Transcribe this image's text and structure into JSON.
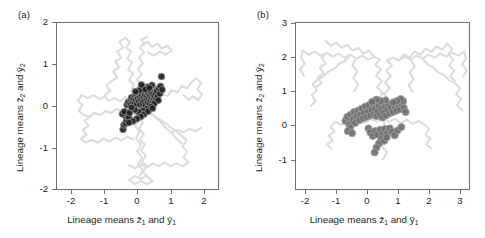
{
  "figure": {
    "panels": [
      {
        "tag": "(a)",
        "axis_x_title_parts": [
          "Lineage means ",
          "z",
          "1",
          " and ",
          "y",
          "1"
        ],
        "axis_y_title_parts": [
          "Lineage means ",
          "z",
          "2",
          " and ",
          "y",
          "2"
        ],
        "xticks": [
          "-2",
          "-1",
          "0",
          "1",
          "2"
        ],
        "yticks": [
          "2",
          "1",
          "0",
          "-1",
          "-2"
        ]
      },
      {
        "tag": "(b)",
        "axis_x_title_parts": [
          "Lineage means ",
          "z",
          "1",
          " and ",
          "y",
          "1"
        ],
        "axis_y_title_parts": [
          "Lineage means ",
          "z",
          "2",
          " and ",
          "y",
          "2"
        ],
        "xticks": [
          "-2",
          "-1",
          "0",
          "1",
          "2",
          "3"
        ],
        "yticks": [
          "3",
          "2",
          "1",
          "0",
          "-1"
        ]
      }
    ]
  },
  "chart_data": [
    {
      "type": "scatter",
      "panel": "(a)",
      "title": "",
      "xlabel": "Lineage means z̄1 and ȳ1",
      "ylabel": "Lineage means z̄2 and ȳ2",
      "xlim": [
        -2.45,
        2.45
      ],
      "ylim": [
        -2.2,
        2.2
      ],
      "xticks": [
        -2,
        -1,
        0,
        1,
        2
      ],
      "yticks": [
        -2,
        -1,
        0,
        1,
        2
      ],
      "grid": false,
      "legend": "none",
      "series": [
        {
          "name": "lineage random-walk trajectories",
          "role": "background-paths",
          "color": "#d9d9d9",
          "description": "Pale grey diffusing random-walk traces radiating from origin; dense lobes near (0,1.4), (-0.8,0.6), (0.9,0.5), (0.6,-1.2), (0,-1.8)."
        },
        {
          "name": "lineage means",
          "role": "markers",
          "marker": "filled-circle-with-ring",
          "fill": "#231f20",
          "edge": "#8c8c8c",
          "points": [
            [
              -0.44,
              -0.62
            ],
            [
              -0.41,
              -0.5
            ],
            [
              -0.36,
              -0.46
            ],
            [
              -0.33,
              -0.38
            ],
            [
              -0.35,
              -0.27
            ],
            [
              -0.3,
              -0.21
            ],
            [
              -0.46,
              -0.21
            ],
            [
              -0.4,
              -0.15
            ],
            [
              -0.27,
              -0.3
            ],
            [
              -0.24,
              -0.18
            ],
            [
              -0.32,
              0.03
            ],
            [
              -0.28,
              0.1
            ],
            [
              -0.22,
              0.06
            ],
            [
              -0.2,
              0.16
            ],
            [
              -0.16,
              0.09
            ],
            [
              -0.18,
              0.22
            ],
            [
              -0.12,
              0.19
            ],
            [
              -0.1,
              0.07
            ],
            [
              -0.08,
              0.25
            ],
            [
              -0.05,
              0.15
            ],
            [
              -0.02,
              0.05
            ],
            [
              -0.04,
              0.28
            ],
            [
              0.0,
              0.2
            ],
            [
              0.02,
              0.31
            ],
            [
              0.04,
              0.12
            ],
            [
              0.06,
              0.24
            ],
            [
              0.08,
              0.04
            ],
            [
              0.09,
              0.33
            ],
            [
              0.11,
              0.17
            ],
            [
              0.13,
              0.27
            ],
            [
              0.15,
              0.08
            ],
            [
              0.16,
              0.36
            ],
            [
              0.18,
              0.21
            ],
            [
              0.2,
              0.13
            ],
            [
              0.22,
              0.3
            ],
            [
              0.24,
              0.02
            ],
            [
              0.25,
              0.38
            ],
            [
              0.27,
              0.18
            ],
            [
              0.29,
              0.26
            ],
            [
              0.31,
              0.1
            ],
            [
              0.33,
              0.33
            ],
            [
              0.35,
              0.2
            ],
            [
              0.36,
              0.05
            ],
            [
              0.38,
              0.29
            ],
            [
              0.4,
              0.15
            ],
            [
              0.42,
              0.36
            ],
            [
              0.44,
              0.22
            ],
            [
              0.46,
              0.09
            ],
            [
              0.47,
              0.31
            ],
            [
              0.49,
              0.18
            ],
            [
              0.51,
              0.27
            ],
            [
              0.53,
              0.12
            ],
            [
              0.55,
              0.34
            ],
            [
              0.57,
              0.21
            ],
            [
              0.59,
              0.4
            ],
            [
              0.61,
              0.26
            ],
            [
              0.63,
              0.15
            ],
            [
              0.65,
              0.46
            ],
            [
              0.68,
              0.33
            ],
            [
              0.7,
              0.52
            ],
            [
              0.73,
              0.78
            ],
            [
              0.75,
              0.43
            ],
            [
              0.44,
              0.55
            ],
            [
              0.3,
              0.5
            ],
            [
              0.18,
              0.48
            ],
            [
              0.06,
              0.42
            ],
            [
              -0.06,
              0.38
            ],
            [
              0.12,
              0.56
            ],
            [
              0.24,
              0.44
            ],
            [
              0.36,
              0.48
            ],
            [
              0.5,
              0.05
            ],
            [
              0.41,
              -0.02
            ],
            [
              0.28,
              -0.08
            ],
            [
              0.16,
              -0.12
            ],
            [
              0.04,
              -0.16
            ],
            [
              -0.08,
              -0.1
            ],
            [
              -0.18,
              -0.04
            ],
            [
              0.2,
              -0.22
            ],
            [
              0.1,
              -0.28
            ],
            [
              -0.02,
              -0.34
            ],
            [
              -0.14,
              -0.4
            ],
            [
              -0.26,
              -0.44
            ],
            [
              0.32,
              -0.14
            ],
            [
              0.46,
              -0.06
            ]
          ]
        }
      ]
    },
    {
      "type": "scatter",
      "panel": "(b)",
      "title": "",
      "xlabel": "Lineage means z̄1 and ȳ1",
      "ylabel": "Lineage means z̄2 and ȳ2",
      "xlim": [
        -2.35,
        3.35
      ],
      "ylim": [
        -1.55,
        3.3
      ],
      "xticks": [
        -2,
        -1,
        0,
        1,
        2,
        3
      ],
      "yticks": [
        -1,
        0,
        1,
        2,
        3
      ],
      "grid": false,
      "legend": "none",
      "series": [
        {
          "name": "lineage random-walk trajectories",
          "role": "background-paths",
          "color": "#d9d9d9",
          "description": "Pale grey traces forming a broad band across the upper region near y=1.5-2.1 spanning x=-2 to 3, plus lighter wisps descending toward the central cluster."
        },
        {
          "name": "lineage means",
          "role": "markers",
          "marker": "filled-circle-with-ring",
          "fill": "#6f6f6f",
          "edge": "#9e9e9e",
          "points": [
            [
              -0.72,
              0.44
            ],
            [
              -0.66,
              0.56
            ],
            [
              -0.6,
              0.34
            ],
            [
              -0.55,
              0.62
            ],
            [
              -0.48,
              0.48
            ],
            [
              -0.44,
              0.7
            ],
            [
              -0.4,
              0.38
            ],
            [
              -0.35,
              0.58
            ],
            [
              -0.3,
              0.74
            ],
            [
              -0.26,
              0.46
            ],
            [
              -0.22,
              0.64
            ],
            [
              -0.18,
              0.8
            ],
            [
              -0.14,
              0.52
            ],
            [
              -0.1,
              0.68
            ],
            [
              -0.06,
              0.86
            ],
            [
              -0.02,
              0.56
            ],
            [
              0.02,
              0.72
            ],
            [
              0.06,
              0.9
            ],
            [
              0.1,
              0.6
            ],
            [
              0.14,
              0.76
            ],
            [
              0.18,
              0.94
            ],
            [
              0.22,
              0.64
            ],
            [
              0.26,
              0.8
            ],
            [
              0.3,
              0.58
            ],
            [
              0.34,
              0.72
            ],
            [
              0.38,
              0.88
            ],
            [
              0.42,
              0.62
            ],
            [
              0.46,
              0.78
            ],
            [
              0.5,
              0.54
            ],
            [
              0.54,
              0.7
            ],
            [
              0.58,
              0.86
            ],
            [
              0.62,
              0.6
            ],
            [
              0.66,
              0.76
            ],
            [
              0.7,
              0.92
            ],
            [
              0.74,
              0.66
            ],
            [
              0.78,
              0.82
            ],
            [
              0.84,
              0.7
            ],
            [
              0.9,
              0.86
            ],
            [
              0.96,
              0.74
            ],
            [
              1.02,
              0.9
            ],
            [
              1.08,
              0.78
            ],
            [
              1.14,
              0.94
            ],
            [
              1.2,
              0.82
            ],
            [
              1.26,
              0.7
            ],
            [
              1.18,
              1.02
            ],
            [
              1.1,
              1.08
            ],
            [
              0.98,
              1.02
            ],
            [
              0.86,
              0.98
            ],
            [
              0.6,
              1.04
            ],
            [
              0.44,
              1.02
            ],
            [
              0.3,
              1.06
            ],
            [
              0.16,
              1.0
            ],
            [
              0.04,
              0.22
            ],
            [
              0.1,
              0.1
            ],
            [
              0.18,
              0.0
            ],
            [
              0.26,
              0.14
            ],
            [
              0.34,
              0.04
            ],
            [
              0.42,
              0.18
            ],
            [
              0.5,
              0.06
            ],
            [
              0.58,
              0.2
            ],
            [
              0.66,
              0.08
            ],
            [
              0.74,
              0.22
            ],
            [
              0.82,
              0.12
            ],
            [
              0.9,
              0.02
            ],
            [
              0.46,
              -0.1
            ],
            [
              0.38,
              -0.22
            ],
            [
              0.3,
              -0.34
            ],
            [
              0.24,
              -0.48
            ],
            [
              0.56,
              -0.14
            ],
            [
              0.64,
              -0.04
            ],
            [
              1.0,
              0.16
            ],
            [
              1.12,
              0.26
            ],
            [
              -0.56,
              0.24
            ],
            [
              -0.64,
              0.14
            ],
            [
              -0.5,
              0.08
            ]
          ]
        }
      ]
    }
  ]
}
